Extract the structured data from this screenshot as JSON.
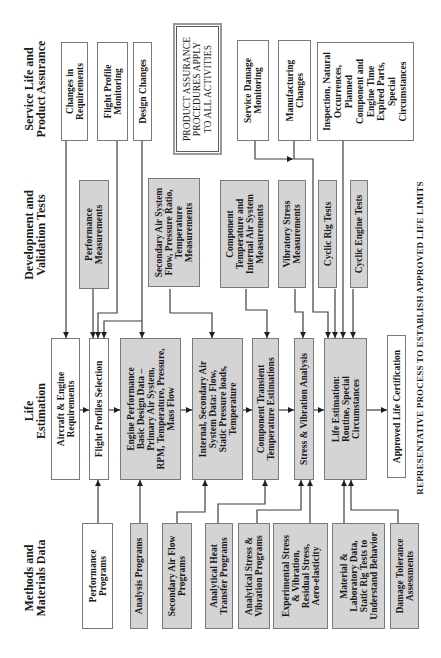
{
  "figure": {
    "caption": "REPRESENTATIVE PROCESS TO ESTABLISH APPROVED LIFE LIMITS",
    "note": "PRODUCT ASSURANCE\nPROCEDURES APPLY\nTO ALL ACTIVITIES"
  },
  "columns": {
    "methods": {
      "header": "Methods and\nMaterials Data",
      "boxes": [
        {
          "label": "Performance\nPrograms",
          "style": "white"
        },
        {
          "label": "Analysis Programs",
          "style": "gray"
        },
        {
          "label": "Secondary Air Flow\nPrograms",
          "style": "gray"
        },
        {
          "label": "Analytical Heat\nTransfer Programs",
          "style": "gray"
        },
        {
          "label": "Analytical Stress &\nVibration Programs",
          "style": "gray"
        },
        {
          "label": "Experimental Stress\n& Vibration,\nResidual Stress,\nAero-elasticity",
          "style": "gray"
        },
        {
          "label": "Material &\nLaboratory Data,\nStatic Rig Tests to\nUnderstand Behavior",
          "style": "gray"
        },
        {
          "label": "Damage Tolerance\nAssessments",
          "style": "gray"
        }
      ]
    },
    "life_estimation": {
      "header": "Life\nEstimation",
      "boxes": [
        {
          "label": "Aircraft & Engine\nRequirements",
          "style": "white"
        },
        {
          "label": "Flight Profiles Selection",
          "style": "white"
        },
        {
          "label": "Engine Performance\nBasic Design Data –\nPrimary Air System,\nRPM, Temperature, Pressure,\nMass Flow",
          "style": "gray"
        },
        {
          "label": "Internal, Secondary Air\nSystem Data: Flow,\nStatic Pressure loads,\nTemperature",
          "style": "gray"
        },
        {
          "label": "Component Transient\nTemperature Estimations",
          "style": "gray"
        },
        {
          "label": "Stress & Vibration Analysis",
          "style": "gray"
        },
        {
          "label": "Life Estimation:\nRoutine, Special\nCircumstances",
          "style": "gray"
        },
        {
          "label": "Approved Life Certification",
          "style": "white"
        }
      ]
    },
    "development": {
      "header": "Development and\nValidation Tests",
      "boxes": [
        {
          "label": "Performance\nMeasurements",
          "style": "gray"
        },
        {
          "label": "Secondary Air System\nFlow, Pressure Ratio,\nTemperature\nMeasurements",
          "style": "gray"
        },
        {
          "label": "Component\nTemperature and\nInternal Air System\nMeasurements",
          "style": "gray"
        },
        {
          "label": "Vibratory Stress\nMeasurements",
          "style": "gray"
        },
        {
          "label": "Cyclic Rig Tests",
          "style": "gray"
        },
        {
          "label": "Cyclic Engine Tests",
          "style": "gray"
        }
      ]
    },
    "service": {
      "header": "Service Life and\nProduct Assurance",
      "boxes": [
        {
          "label": "Changes in\nRequirements",
          "style": "white"
        },
        {
          "label": "Flight Profile\nMonitoring",
          "style": "white"
        },
        {
          "label": "Design Changes",
          "style": "white"
        },
        {
          "label": "Service Damage\nMonitoring",
          "style": "white"
        },
        {
          "label": "Manufacturing\nChanges",
          "style": "white"
        },
        {
          "label": "Inspection, Natural\nOccurrences,\nPlanned\nComponent and\nEngine Time\nExpired Parts,\nSpecial\nCircumstances",
          "style": "white"
        }
      ]
    }
  },
  "colors": {
    "gray_box": "#d4d4d4",
    "white_box": "#ffffff",
    "border": "#7a7a7a",
    "connector": "#3f3f3f",
    "text": "#1a1a1a"
  }
}
